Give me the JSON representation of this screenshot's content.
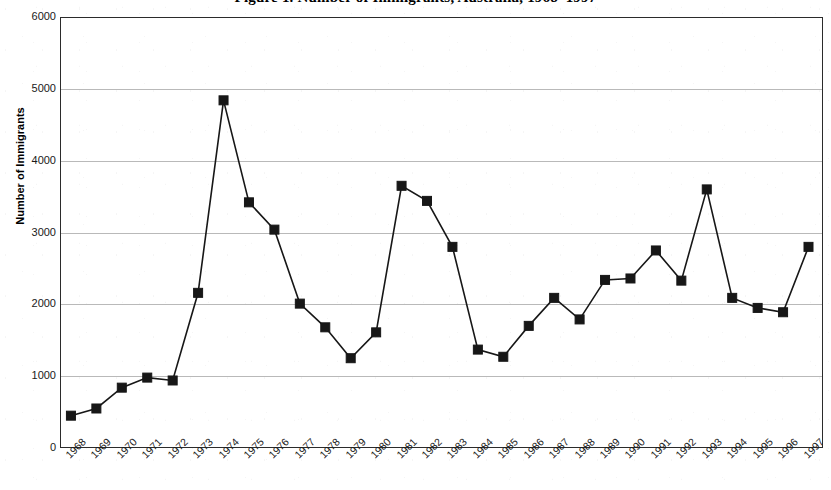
{
  "chart_data": {
    "type": "line",
    "title": "Figure 1. Number of Immigrants, Australia, 1968–1997",
    "xlabel": "",
    "ylabel": "Number of Immigrants",
    "ylim": [
      0,
      6000
    ],
    "ytick_step": 1000,
    "yticks": [
      0,
      1000,
      2000,
      3000,
      4000,
      5000,
      6000
    ],
    "ytick_labels": [
      "0",
      "1000",
      "2000",
      "3000",
      "4000",
      "5000",
      "6000"
    ],
    "grid": true,
    "legend": false,
    "legend_position": "none",
    "marker": "square",
    "marker_color": "#171717",
    "line_color": "#171717",
    "categories": [
      "1968",
      "1969",
      "1970",
      "1971",
      "1972",
      "1973",
      "1974",
      "1975",
      "1976",
      "1977",
      "1978",
      "1979",
      "1980",
      "1981",
      "1982",
      "1983",
      "1984",
      "1985",
      "1986",
      "1987",
      "1988",
      "1989",
      "1990",
      "1991",
      "1992",
      "1993",
      "1994",
      "1995",
      "1996",
      "1997"
    ],
    "values": [
      450,
      550,
      840,
      980,
      940,
      2160,
      4840,
      3420,
      3040,
      2010,
      1680,
      1250,
      1610,
      3650,
      3440,
      2800,
      1370,
      1270,
      1700,
      2090,
      1790,
      2340,
      2360,
      2750,
      2330,
      3600,
      2090,
      1950,
      1890,
      2800
    ]
  },
  "colors": {
    "line": "#171717",
    "grid": "#b9b9b9",
    "frame": "#2b2b2b",
    "text": "#1a1a1a",
    "background": "#ffffff"
  }
}
